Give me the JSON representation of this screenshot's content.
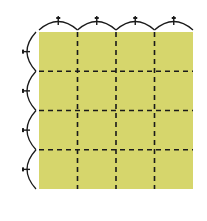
{
  "diagram": {
    "type": "origami-grid-fold",
    "grid": {
      "rows": 4,
      "cols": 4
    },
    "colors": {
      "paper": "#d6d66c",
      "line": "#1a1a1a",
      "background": "#ffffff"
    },
    "paper": {
      "x": 39,
      "y": 32,
      "width": 154,
      "height": 157
    },
    "dashed_lines": {
      "vertical_x": [
        77.5,
        116,
        154.5
      ],
      "horizontal_y": [
        71.25,
        110.5,
        149.75
      ]
    },
    "division_marks": {
      "top_arcs": 4,
      "left_arcs": 4
    }
  }
}
